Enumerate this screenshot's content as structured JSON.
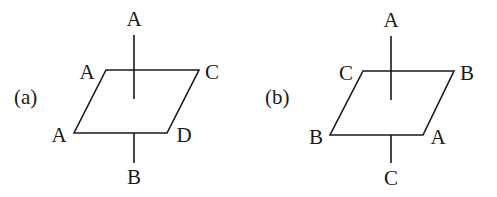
{
  "diagrams": [
    {
      "id": "a",
      "panel_label": "(a)",
      "labels": {
        "axis_top": "A",
        "top_left": "A",
        "top_right": "C",
        "bottom_left": "A",
        "bottom_right": "D",
        "axis_bottom": "B"
      },
      "geometry": {
        "parallelogram": [
          [
            106,
            70
          ],
          [
            199,
            70
          ],
          [
            167,
            133
          ],
          [
            74,
            133
          ]
        ],
        "axis_x": 134,
        "axis_top_y": [
          35,
          99
        ],
        "axis_bottom_y": [
          133,
          163
        ]
      }
    },
    {
      "id": "b",
      "panel_label": "(b)",
      "labels": {
        "axis_top": "A",
        "top_left": "C",
        "top_right": "B",
        "bottom_left": "B",
        "bottom_right": "A",
        "axis_bottom": "C"
      },
      "geometry": {
        "parallelogram": [
          [
            363,
            71
          ],
          [
            454,
            71
          ],
          [
            423,
            135
          ],
          [
            330,
            135
          ]
        ],
        "axis_x": 391,
        "axis_top_y": [
          36,
          100
        ],
        "axis_bottom_y": [
          135,
          163
        ]
      }
    }
  ],
  "colors": {
    "line": "#1a1a1a",
    "background": "#ffffff"
  }
}
